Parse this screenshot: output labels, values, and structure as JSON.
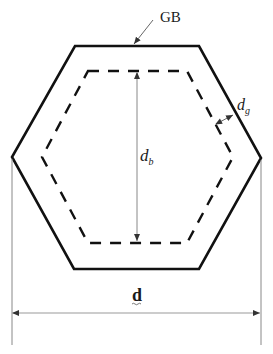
{
  "diagram": {
    "labels": {
      "gb": "GB",
      "db_main": "d",
      "db_sub": "b",
      "dg_main": "d",
      "dg_sub": "g",
      "d": "d"
    },
    "colors": {
      "outline": "#111111",
      "dimension_line": "#888888",
      "text": "#1a1a1a"
    }
  }
}
